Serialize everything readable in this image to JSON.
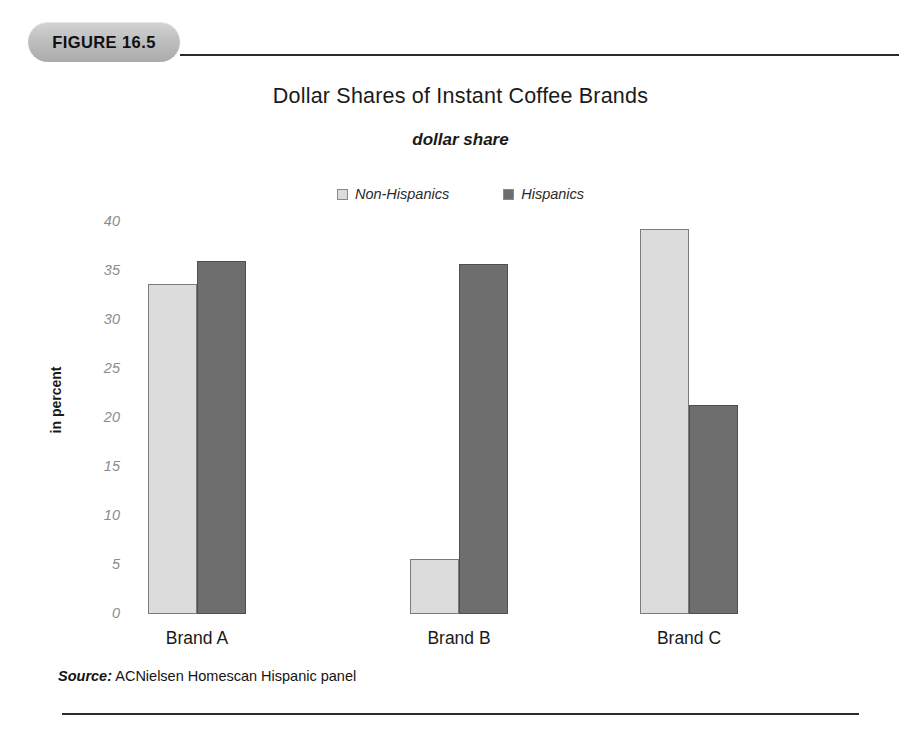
{
  "figure": {
    "badge_label": "FIGURE 16.5",
    "source_label": "Source:",
    "source_text": "ACNielsen Homescan Hispanic panel"
  },
  "colors": {
    "light_series": "#dcdcdc",
    "dark_series": "#6e6e6e",
    "badge": "#bfbfbf",
    "tick_text": "#8d8d8d",
    "rule": "#2a2a2a"
  },
  "chart_data": {
    "type": "bar",
    "title": "Dollar Shares of Instant Coffee Brands",
    "subtitle": "dollar share",
    "xlabel": "",
    "ylabel": "in percent",
    "ylim": [
      0,
      40
    ],
    "yticks": [
      40,
      35,
      30,
      25,
      20,
      15,
      10,
      5,
      0
    ],
    "grid": false,
    "legend_position": "top-center",
    "categories": [
      "Brand A",
      "Brand B",
      "Brand C"
    ],
    "series": [
      {
        "name": "Non-Hispanics",
        "values": [
          33.7,
          5.6,
          39.3
        ]
      },
      {
        "name": "Hispanics",
        "values": [
          36.0,
          35.7,
          21.3
        ]
      }
    ]
  }
}
